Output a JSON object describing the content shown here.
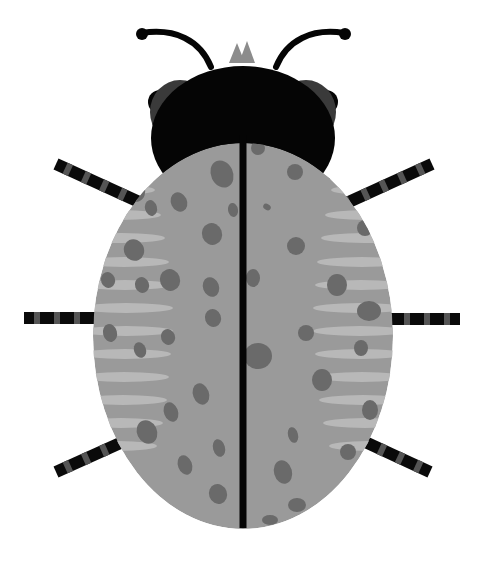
{
  "canvas": {
    "width": 484,
    "height": 573,
    "background": "#ffffff"
  },
  "colors": {
    "body": "#9a9a9a",
    "spot": "#6a6a6a",
    "stripe": "#b8b8b8",
    "head": "#050505",
    "eye_shadow": "#3a3a3a",
    "leg_dark": "#0a0a0a",
    "leg_light": "#555555",
    "horn": "#8c8c8c",
    "seam": "#050505"
  },
  "body": {
    "cx": 243,
    "cy": 336,
    "rx": 150,
    "ry": 193
  },
  "seam": {
    "x": 243,
    "y1": 135,
    "y2": 528,
    "width": 7
  },
  "head": {
    "cx": 243,
    "cy": 138,
    "rx": 92,
    "ry": 72
  },
  "eyes": [
    {
      "cx": 160,
      "cy": 102,
      "r": 12
    },
    {
      "cx": 326,
      "cy": 102,
      "r": 12
    }
  ],
  "eye_shadows": [
    {
      "cx": 180,
      "cy": 112,
      "rx": 30,
      "ry": 32
    },
    {
      "cx": 306,
      "cy": 112,
      "rx": 30,
      "ry": 32
    }
  ],
  "horns": [
    {
      "points": "229,63 237,43 245,63"
    },
    {
      "points": "239,63 247,41 255,63"
    }
  ],
  "antennae": [
    {
      "d": "M211,67 C200,40 175,28 142,33",
      "tip": {
        "cx": 142,
        "cy": 34,
        "r": 6
      }
    },
    {
      "d": "M276,67 C287,40 312,28 344,33",
      "tip": {
        "cx": 345,
        "cy": 34,
        "r": 6
      }
    }
  ],
  "legs": [
    {
      "x1": 56,
      "y1": 164,
      "x2": 126,
      "y2": 196
    },
    {
      "x1": 24,
      "y1": 318,
      "x2": 98,
      "y2": 318
    },
    {
      "x1": 56,
      "y1": 472,
      "x2": 127,
      "y2": 440
    },
    {
      "x1": 432,
      "y1": 164,
      "x2": 362,
      "y2": 196
    },
    {
      "x1": 460,
      "y1": 319,
      "x2": 388,
      "y2": 319
    },
    {
      "x1": 430,
      "y1": 472,
      "x2": 361,
      "y2": 440
    }
  ],
  "stripes_left": [
    {
      "y": 165,
      "w": 40
    },
    {
      "y": 190,
      "w": 48
    },
    {
      "y": 215,
      "w": 54
    },
    {
      "y": 238,
      "w": 58
    },
    {
      "y": 262,
      "w": 62
    },
    {
      "y": 285,
      "w": 64
    },
    {
      "y": 308,
      "w": 66
    },
    {
      "y": 331,
      "w": 66
    },
    {
      "y": 354,
      "w": 64
    },
    {
      "y": 377,
      "w": 62
    },
    {
      "y": 400,
      "w": 60
    },
    {
      "y": 423,
      "w": 56
    },
    {
      "y": 446,
      "w": 50
    }
  ],
  "stripes_right": [
    {
      "y": 165,
      "w": 40
    },
    {
      "y": 190,
      "w": 48
    },
    {
      "y": 215,
      "w": 54
    },
    {
      "y": 238,
      "w": 58
    },
    {
      "y": 262,
      "w": 62
    },
    {
      "y": 285,
      "w": 64
    },
    {
      "y": 308,
      "w": 66
    },
    {
      "y": 331,
      "w": 66
    },
    {
      "y": 354,
      "w": 64
    },
    {
      "y": 377,
      "w": 62
    },
    {
      "y": 400,
      "w": 60
    },
    {
      "y": 423,
      "w": 56
    },
    {
      "y": 446,
      "w": 50
    }
  ],
  "spots": [
    {
      "cx": 222,
      "cy": 174,
      "rx": 11,
      "ry": 14,
      "rot": -25
    },
    {
      "cx": 179,
      "cy": 202,
      "rx": 8,
      "ry": 10,
      "rot": -25
    },
    {
      "cx": 212,
      "cy": 234,
      "rx": 10,
      "ry": 11,
      "rot": -20
    },
    {
      "cx": 170,
      "cy": 280,
      "rx": 10,
      "ry": 11,
      "rot": -20
    },
    {
      "cx": 211,
      "cy": 287,
      "rx": 8,
      "ry": 10,
      "rot": -20
    },
    {
      "cx": 213,
      "cy": 318,
      "rx": 8,
      "ry": 9,
      "rot": -20
    },
    {
      "cx": 168,
      "cy": 337,
      "rx": 7,
      "ry": 8,
      "rot": -20
    },
    {
      "cx": 233,
      "cy": 210,
      "rx": 5,
      "ry": 7,
      "rot": -10
    },
    {
      "cx": 135,
      "cy": 190,
      "rx": 10,
      "ry": 12,
      "rot": -20
    },
    {
      "cx": 151,
      "cy": 208,
      "rx": 6,
      "ry": 8,
      "rot": -15
    },
    {
      "cx": 134,
      "cy": 250,
      "rx": 10,
      "ry": 11,
      "rot": -25
    },
    {
      "cx": 108,
      "cy": 280,
      "rx": 7,
      "ry": 8,
      "rot": -20
    },
    {
      "cx": 142,
      "cy": 285,
      "rx": 7,
      "ry": 8,
      "rot": -20
    },
    {
      "cx": 110,
      "cy": 333,
      "rx": 7,
      "ry": 9,
      "rot": -15
    },
    {
      "cx": 140,
      "cy": 350,
      "rx": 6,
      "ry": 8,
      "rot": -20
    },
    {
      "cx": 201,
      "cy": 394,
      "rx": 8,
      "ry": 11,
      "rot": -20
    },
    {
      "cx": 171,
      "cy": 412,
      "rx": 7,
      "ry": 10,
      "rot": -20
    },
    {
      "cx": 147,
      "cy": 432,
      "rx": 10,
      "ry": 12,
      "rot": -25
    },
    {
      "cx": 219,
      "cy": 448,
      "rx": 6,
      "ry": 9,
      "rot": -15
    },
    {
      "cx": 185,
      "cy": 465,
      "rx": 7,
      "ry": 10,
      "rot": -20
    },
    {
      "cx": 218,
      "cy": 494,
      "rx": 9,
      "ry": 10,
      "rot": -20
    },
    {
      "cx": 258,
      "cy": 148,
      "rx": 7,
      "ry": 7,
      "rot": 0
    },
    {
      "cx": 295,
      "cy": 172,
      "rx": 8,
      "ry": 8,
      "rot": 0
    },
    {
      "cx": 267,
      "cy": 207,
      "rx": 4,
      "ry": 3,
      "rot": 30
    },
    {
      "cx": 296,
      "cy": 246,
      "rx": 9,
      "ry": 9,
      "rot": 0
    },
    {
      "cx": 253,
      "cy": 278,
      "rx": 7,
      "ry": 9,
      "rot": 0
    },
    {
      "cx": 306,
      "cy": 333,
      "rx": 8,
      "ry": 8,
      "rot": 0
    },
    {
      "cx": 258,
      "cy": 356,
      "rx": 14,
      "ry": 13,
      "rot": 0
    },
    {
      "cx": 322,
      "cy": 380,
      "rx": 10,
      "ry": 11,
      "rot": 0
    },
    {
      "cx": 293,
      "cy": 435,
      "rx": 5,
      "ry": 8,
      "rot": -15
    },
    {
      "cx": 283,
      "cy": 472,
      "rx": 9,
      "ry": 12,
      "rot": -15
    },
    {
      "cx": 297,
      "cy": 505,
      "rx": 9,
      "ry": 7,
      "rot": 0
    },
    {
      "cx": 270,
      "cy": 520,
      "rx": 8,
      "ry": 5,
      "rot": 0
    },
    {
      "cx": 336,
      "cy": 172,
      "rx": 10,
      "ry": 9,
      "rot": 0
    },
    {
      "cx": 365,
      "cy": 228,
      "rx": 8,
      "ry": 8,
      "rot": 0
    },
    {
      "cx": 337,
      "cy": 285,
      "rx": 10,
      "ry": 11,
      "rot": 0
    },
    {
      "cx": 369,
      "cy": 311,
      "rx": 12,
      "ry": 10,
      "rot": 0
    },
    {
      "cx": 361,
      "cy": 348,
      "rx": 7,
      "ry": 8,
      "rot": 0
    },
    {
      "cx": 370,
      "cy": 410,
      "rx": 8,
      "ry": 10,
      "rot": 0
    },
    {
      "cx": 348,
      "cy": 452,
      "rx": 8,
      "ry": 8,
      "rot": 0
    }
  ]
}
